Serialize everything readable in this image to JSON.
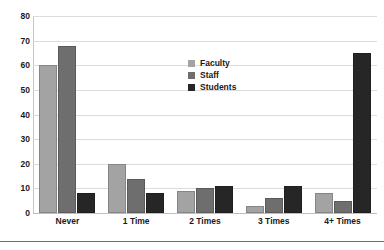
{
  "chart_data": {
    "type": "bar",
    "title": "",
    "xlabel": "",
    "ylabel": "",
    "ylim": [
      0,
      80
    ],
    "ytick_step": 10,
    "yticks": [
      "80",
      "70",
      "60",
      "50",
      "40",
      "30",
      "20",
      "10",
      "0"
    ],
    "grid": true,
    "legend_position": "inside-upper-center-right",
    "categories": [
      "Never",
      "1 Time",
      "2 Times",
      "3 Times",
      "4+ Times"
    ],
    "series": [
      {
        "name": "Faculty",
        "color": "#a3a3a3",
        "values": [
          60,
          20,
          9,
          3,
          8
        ]
      },
      {
        "name": "Staff",
        "color": "#6e6e6e",
        "values": [
          68,
          14,
          10,
          6,
          5
        ]
      },
      {
        "name": "Students",
        "color": "#262626",
        "values": [
          8,
          8,
          11,
          11,
          65
        ]
      }
    ]
  },
  "colors": {
    "faculty": "#a3a3a3",
    "staff": "#6e6e6e",
    "students": "#262626",
    "gridline": "#dcdcdc",
    "axis": "#c4c4c4",
    "footer_rule": "#6b6b6b",
    "text": "#1a1a1a",
    "background": "#ffffff"
  }
}
